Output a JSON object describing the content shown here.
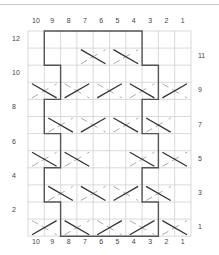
{
  "chart": {
    "type": "cable-knitting-chart",
    "columns": 10,
    "rows": 12,
    "column_labels_top": [
      "10",
      "9",
      "8",
      "7",
      "6",
      "5",
      "4",
      "3",
      "2",
      "1"
    ],
    "column_labels_bottom": [
      "10",
      "9",
      "8",
      "7",
      "6",
      "5",
      "4",
      "3",
      "2",
      "1"
    ],
    "row_labels_left": [
      {
        "row": 12,
        "label": "12"
      },
      {
        "row": 10,
        "label": "10"
      },
      {
        "row": 8,
        "label": "8"
      },
      {
        "row": 6,
        "label": "6"
      },
      {
        "row": 4,
        "label": "4"
      },
      {
        "row": 2,
        "label": "2"
      }
    ],
    "row_labels_right": [
      {
        "row": 11,
        "label": "11"
      },
      {
        "row": 9,
        "label": "9"
      },
      {
        "row": 7,
        "label": "7"
      },
      {
        "row": 5,
        "label": "5"
      },
      {
        "row": 3,
        "label": "3"
      },
      {
        "row": 1,
        "label": "1"
      }
    ],
    "crosses": [
      {
        "row": 11,
        "cols": [
          7,
          6
        ],
        "dark": "back"
      },
      {
        "row": 11,
        "cols": [
          5,
          4
        ],
        "dark": "back"
      },
      {
        "row": 9,
        "cols": [
          10,
          9
        ],
        "dark": "back"
      },
      {
        "row": 9,
        "cols": [
          8,
          7
        ],
        "dark": "fwd"
      },
      {
        "row": 9,
        "cols": [
          6,
          5
        ],
        "dark": "fwd"
      },
      {
        "row": 9,
        "cols": [
          4,
          3
        ],
        "dark": "back"
      },
      {
        "row": 9,
        "cols": [
          2,
          1
        ],
        "dark": "fwd"
      },
      {
        "row": 7,
        "cols": [
          9,
          8
        ],
        "dark": "back"
      },
      {
        "row": 7,
        "cols": [
          7,
          6
        ],
        "dark": "fwd"
      },
      {
        "row": 7,
        "cols": [
          5,
          4
        ],
        "dark": "back"
      },
      {
        "row": 7,
        "cols": [
          3,
          2
        ],
        "dark": "back"
      },
      {
        "row": 5,
        "cols": [
          10,
          9
        ],
        "dark": "back"
      },
      {
        "row": 5,
        "cols": [
          8,
          7
        ],
        "dark": "back"
      },
      {
        "row": 5,
        "cols": [
          4,
          3
        ],
        "dark": "back"
      },
      {
        "row": 5,
        "cols": [
          2,
          1
        ],
        "dark": "back"
      },
      {
        "row": 3,
        "cols": [
          9,
          8
        ],
        "dark": "back"
      },
      {
        "row": 3,
        "cols": [
          7,
          6
        ],
        "dark": "back"
      },
      {
        "row": 3,
        "cols": [
          5,
          4
        ],
        "dark": "fwd"
      },
      {
        "row": 3,
        "cols": [
          3,
          2
        ],
        "dark": "back"
      },
      {
        "row": 1,
        "cols": [
          10,
          9
        ],
        "dark": "fwd"
      },
      {
        "row": 1,
        "cols": [
          8,
          7
        ],
        "dark": "back"
      },
      {
        "row": 1,
        "cols": [
          6,
          5
        ],
        "dark": "fwd"
      },
      {
        "row": 1,
        "cols": [
          4,
          3
        ],
        "dark": "fwd"
      },
      {
        "row": 1,
        "cols": [
          2,
          1
        ],
        "dark": "back"
      }
    ],
    "outline": {
      "left_boundary_col_left_edge_by_row_pair": {
        "12-11": 9,
        "10-9": 8,
        "8-7": 9,
        "6-5": 8,
        "4-3": 9,
        "2-1": 8
      },
      "right_boundary_col_right_edge_by_row_pair": {
        "12-11": 4,
        "10-9": 3,
        "8-7": 4,
        "6-5": 3,
        "4-3": 4,
        "2-1": 3
      }
    },
    "colors": {
      "grid": "#cfcfcf",
      "outline": "#555555",
      "cross_dark": "#333333",
      "cross_light": "#aaaaaa"
    }
  }
}
